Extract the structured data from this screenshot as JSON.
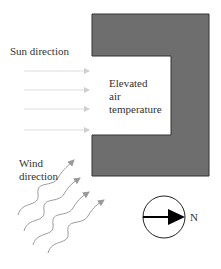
{
  "diagram": {
    "type": "site-microclimate-plan",
    "building": {
      "label": "Elevated air temperature",
      "label_lines": [
        "Elevated",
        "air",
        "temperature"
      ],
      "fill": "#6e6e6e",
      "stroke": "#333333"
    },
    "sun": {
      "label": "Sun direction",
      "arrow_count": 4,
      "arrow_color": "#cfcfcf"
    },
    "wind": {
      "label_lines": [
        "Wind",
        "direction"
      ],
      "arrow_count": 4,
      "arrow_color": "#999999"
    },
    "compass": {
      "label": "N",
      "direction": "east"
    }
  }
}
